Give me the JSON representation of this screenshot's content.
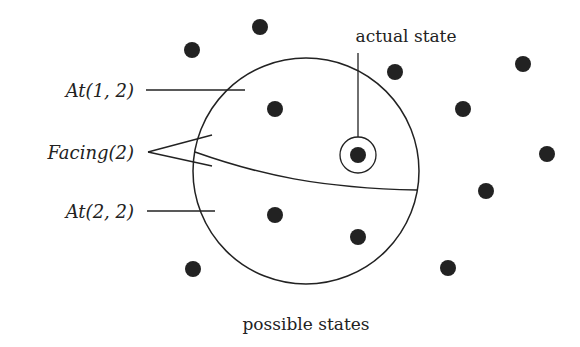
{
  "diagram": {
    "labels": {
      "actual_state": "actual state",
      "possible_states": "possible states",
      "at_1_2": "At(1, 2)",
      "facing_2": "Facing(2)",
      "at_2_2": "At(2, 2)"
    },
    "colors": {
      "ink": "#222222",
      "background": "#ffffff"
    },
    "region_circle": {
      "cx": 306,
      "cy": 171,
      "r": 113
    },
    "actual_state_marker": {
      "cx": 357,
      "cy": 155,
      "ring_r": 18,
      "dot_r": 8
    },
    "state_dots": [
      {
        "cx": 260,
        "cy": 27
      },
      {
        "cx": 192,
        "cy": 50
      },
      {
        "cx": 395,
        "cy": 72
      },
      {
        "cx": 523,
        "cy": 64
      },
      {
        "cx": 275,
        "cy": 109
      },
      {
        "cx": 463,
        "cy": 109
      },
      {
        "cx": 547,
        "cy": 154
      },
      {
        "cx": 486,
        "cy": 191
      },
      {
        "cx": 275,
        "cy": 215
      },
      {
        "cx": 358,
        "cy": 237
      },
      {
        "cx": 193,
        "cy": 269
      },
      {
        "cx": 448,
        "cy": 268
      }
    ]
  }
}
